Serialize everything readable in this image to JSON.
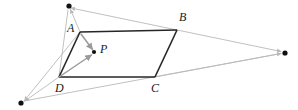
{
  "figure": {
    "width": 298,
    "height": 110,
    "background": "#ffffff"
  },
  "style": {
    "parallelogram_stroke": "#262626",
    "parallelogram_stroke_width": 1.6,
    "construction_stroke": "#b9b9b9",
    "construction_stroke_width": 0.9,
    "vector_stroke": "#9a9a9a",
    "vector_stroke_width": 1.5,
    "dot_fill": "#111111",
    "label_color": "#1a1a1a",
    "label_font_size": 12
  },
  "vertices": [
    {
      "id": "A",
      "label": "A",
      "x": 80,
      "y": 32,
      "label_x": 67,
      "label_y": 22,
      "dot": false
    },
    {
      "id": "B",
      "label": "B",
      "x": 177,
      "y": 30,
      "label_x": 179,
      "label_y": 11,
      "dot": false
    },
    {
      "id": "C",
      "label": "C",
      "x": 155,
      "y": 77,
      "label_x": 151,
      "label_y": 82,
      "dot": false
    },
    {
      "id": "D",
      "label": "D",
      "x": 59,
      "y": 77,
      "label_x": 55,
      "label_y": 82,
      "dot": false
    }
  ],
  "interior_point": {
    "id": "P",
    "label": "P",
    "x": 94,
    "y": 52,
    "label_x": 100,
    "label_y": 43,
    "radius": 2.1
  },
  "external_points": [
    {
      "id": "V-top",
      "name": "top-vanishing-point",
      "x": 69,
      "y": 6,
      "radius": 2.6
    },
    {
      "id": "V-right",
      "name": "right-vanishing-point",
      "x": 285,
      "y": 53,
      "radius": 2.6
    },
    {
      "id": "V-bottom-left",
      "name": "bottom-left-vanishing-point",
      "x": 21,
      "y": 103,
      "radius": 2.6
    }
  ],
  "parallelogram_edges": [
    {
      "from": "A",
      "to": "B"
    },
    {
      "from": "B",
      "to": "C"
    },
    {
      "from": "C",
      "to": "D"
    },
    {
      "from": "D",
      "to": "A"
    }
  ],
  "vectors": [
    {
      "name": "vector-D-to-P",
      "from": "D",
      "to": "P",
      "x1": 59,
      "y1": 77,
      "x2": 92,
      "y2": 55,
      "arrow": true
    },
    {
      "name": "vector-A-to-P",
      "from": "A",
      "to": "P",
      "x1": 81,
      "y1": 34,
      "x2": 93,
      "y2": 50,
      "arrow": true
    }
  ],
  "construction_lines": [
    {
      "name": "line-B-to-top-vanishing-point",
      "x1": 177,
      "y1": 30,
      "x2": 71,
      "y2": 8,
      "arrow": true
    },
    {
      "name": "line-A-to-top-vanishing-point",
      "x1": 80,
      "y1": 32,
      "x2": 70,
      "y2": 9,
      "arrow": true
    },
    {
      "name": "line-D-to-top-vanishing-point",
      "x1": 59,
      "y1": 77,
      "x2": 68,
      "y2": 9,
      "arrow": true
    },
    {
      "name": "line-B-to-right-vanishing-point",
      "x1": 177,
      "y1": 30,
      "x2": 282,
      "y2": 52,
      "arrow": true
    },
    {
      "name": "line-C-to-right-vanishing-point",
      "x1": 155,
      "y1": 77,
      "x2": 282,
      "y2": 54,
      "arrow": true
    },
    {
      "name": "line-D-through-C-to-right-vanishing-point",
      "x1": 24,
      "y1": 101,
      "x2": 282,
      "y2": 54,
      "arrow": true
    },
    {
      "name": "line-A-to-bottom-left-vanishing-point",
      "x1": 80,
      "y1": 32,
      "x2": 24,
      "y2": 101,
      "arrow": true
    },
    {
      "name": "line-D-to-bottom-left-vanishing-point",
      "x1": 59,
      "y1": 77,
      "x2": 24,
      "y2": 101,
      "arrow": true
    }
  ]
}
